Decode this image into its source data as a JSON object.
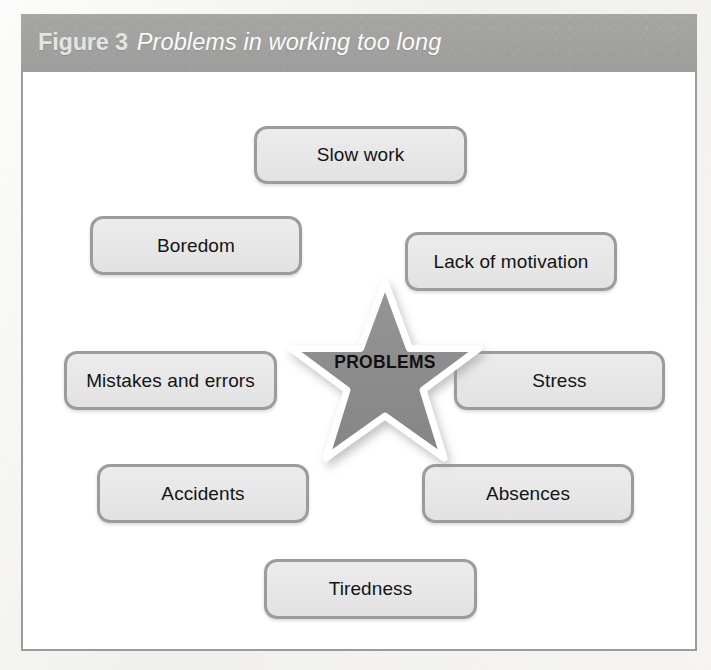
{
  "figure": {
    "label": "Figure 3",
    "title": "Problems in working too long"
  },
  "center": {
    "icon": "star-icon",
    "label": "PROBLEMS"
  },
  "colors": {
    "caption_bar": "#a1a19f",
    "caption_text": "#ffffff",
    "panel_background": "#ffffff",
    "panel_border": "#9b9b99",
    "box_fill": "#e8e8e8",
    "box_border": "#9c9c9c",
    "box_text": "#141414",
    "star_fill": "#8c8c8c",
    "star_outline": "#ffffff",
    "page_background": "#f3f2ef"
  },
  "chart_data": {
    "type": "diagram",
    "layout": "radial-star-burst",
    "title": "Problems in working too long",
    "center_node": "PROBLEMS",
    "nodes": [
      "Slow work",
      "Boredom",
      "Lack of motivation",
      "Mistakes and errors",
      "Stress",
      "Accidents",
      "Absences",
      "Tiredness"
    ]
  },
  "boxes": [
    {
      "id": "slow-work",
      "label": "Slow work",
      "x": 231,
      "y": 54,
      "w": 213,
      "h": 58
    },
    {
      "id": "boredom",
      "label": "Boredom",
      "x": 67,
      "y": 144,
      "w": 212,
      "h": 59
    },
    {
      "id": "lack-of-motivation",
      "label": "Lack of motivation",
      "x": 382,
      "y": 160,
      "w": 212,
      "h": 59
    },
    {
      "id": "mistakes-and-errors",
      "label": "Mistakes and errors",
      "x": 41,
      "y": 279,
      "w": 213,
      "h": 59
    },
    {
      "id": "stress",
      "label": "Stress",
      "x": 431,
      "y": 279,
      "w": 211,
      "h": 59
    },
    {
      "id": "accidents",
      "label": "Accidents",
      "x": 74,
      "y": 392,
      "w": 212,
      "h": 59
    },
    {
      "id": "absences",
      "label": "Absences",
      "x": 399,
      "y": 392,
      "w": 212,
      "h": 59
    },
    {
      "id": "tiredness",
      "label": "Tiredness",
      "x": 241,
      "y": 487,
      "w": 213,
      "h": 60
    }
  ]
}
